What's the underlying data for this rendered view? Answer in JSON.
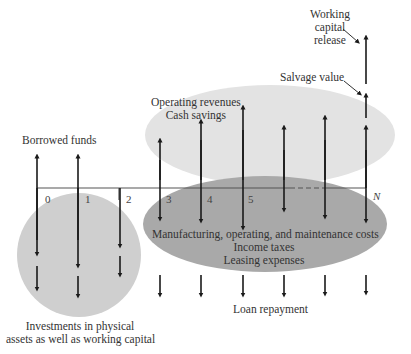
{
  "diagram": {
    "type": "cash-flow-diagram",
    "timeline": {
      "periods": [
        "0",
        "1",
        "2",
        "3",
        "4",
        "5",
        "N"
      ],
      "line_color": "#555555",
      "dashed_segment": "between last unlabeled period and N"
    },
    "regions": {
      "inflow_ellipse": {
        "color": "#e3e3e3",
        "labels": [
          "Operating revenues",
          "Cash savings"
        ]
      },
      "outflow_ellipse": {
        "color": "#a9a9a9",
        "labels": [
          "Manufacturing, operating, and maintenance costs",
          "Income taxes",
          "Leasing expenses"
        ]
      },
      "investment_circle": {
        "color": "#cfcfcf",
        "labels": [
          "Investments in physical",
          "assets as well as working capital"
        ]
      }
    },
    "annotations": {
      "borrowed_funds": "Borrowed funds",
      "loan_repayment": "Loan repayment",
      "salvage_value": "Salvage value",
      "working_capital_release": [
        "Working",
        "capital",
        "release"
      ]
    },
    "arrow_color": "#1a1a1a"
  }
}
